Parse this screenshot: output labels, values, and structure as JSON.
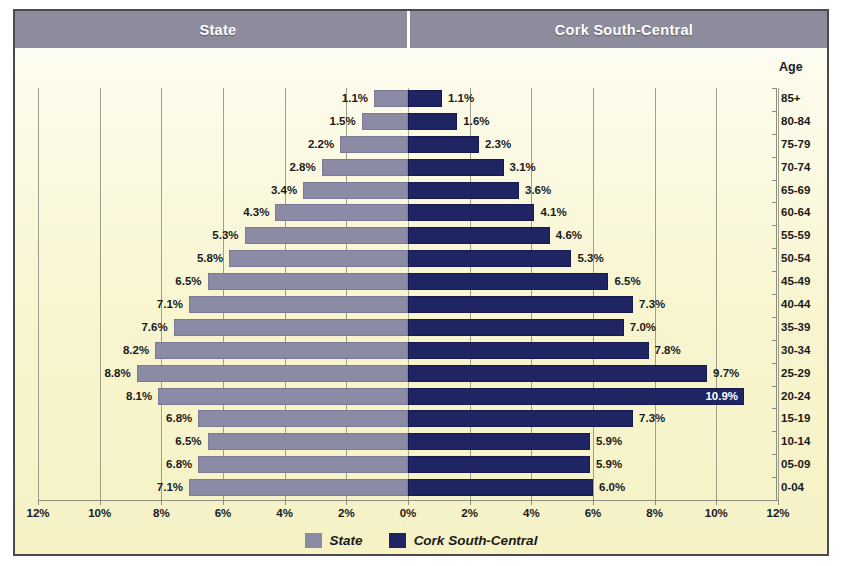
{
  "header": {
    "left_title": "State",
    "right_title": "Cork South-Central"
  },
  "age_axis_title": "Age",
  "legend": {
    "items": [
      {
        "label": "State",
        "color": "#8b8ba6"
      },
      {
        "label": "Cork South-Central",
        "color": "#1f2463"
      }
    ]
  },
  "chart_data": {
    "type": "bar",
    "subtype": "population-pyramid",
    "title": "",
    "xlabel": "",
    "ylabel": "Age",
    "categories": [
      "85+",
      "80-84",
      "75-79",
      "70-74",
      "65-69",
      "60-64",
      "55-59",
      "50-54",
      "45-49",
      "40-44",
      "35-39",
      "30-34",
      "25-29",
      "20-24",
      "15-19",
      "10-14",
      "05-09",
      "0-04"
    ],
    "series": [
      {
        "name": "State",
        "side": "left",
        "color": "#8b8ba6",
        "values": [
          1.1,
          1.5,
          2.2,
          2.8,
          3.4,
          4.3,
          5.3,
          5.8,
          6.5,
          7.1,
          7.6,
          8.2,
          8.8,
          8.1,
          6.8,
          6.5,
          6.8,
          7.1
        ],
        "labels": [
          "1.1%",
          "1.5%",
          "2.2%",
          "2.8%",
          "3.4%",
          "4.3%",
          "5.3%",
          "5.8%",
          "6.5%",
          "7.1%",
          "7.6%",
          "8.2%",
          "8.8%",
          "8.1%",
          "6.8%",
          "6.5%",
          "6.8%",
          "7.1%"
        ]
      },
      {
        "name": "Cork South-Central",
        "side": "right",
        "color": "#1f2463",
        "values": [
          1.1,
          1.6,
          2.3,
          3.1,
          3.6,
          4.1,
          4.6,
          5.3,
          6.5,
          7.3,
          7.0,
          7.8,
          9.7,
          10.9,
          7.3,
          5.9,
          5.9,
          6.0
        ],
        "labels": [
          "1.1%",
          "1.6%",
          "2.3%",
          "3.1%",
          "3.6%",
          "4.1%",
          "4.6%",
          "5.3%",
          "6.5%",
          "7.3%",
          "7.0%",
          "7.8%",
          "9.7%",
          "10.9%",
          "7.3%",
          "5.9%",
          "5.9%",
          "6.0%"
        ]
      }
    ],
    "xlim": [
      -12,
      12
    ],
    "xticks": [
      12,
      10,
      8,
      6,
      4,
      2,
      0,
      2,
      4,
      6,
      8,
      10,
      12
    ],
    "xtick_labels": [
      "12%",
      "10%",
      "8%",
      "6%",
      "4%",
      "2%",
      "0%",
      "2%",
      "4%",
      "6%",
      "8%",
      "10%",
      "12%"
    ],
    "grid": true,
    "legend_position": "bottom"
  }
}
